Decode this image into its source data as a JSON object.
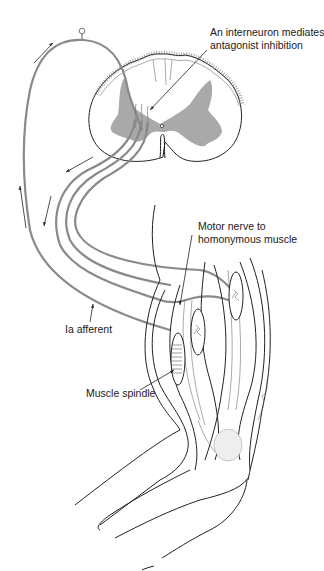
{
  "diagram": {
    "labels": {
      "interneuron": [
        "An interneuron mediates",
        "antagonist inhibition"
      ],
      "motor_nerve": [
        "Motor nerve to",
        "homonymous muscle"
      ],
      "ia_afferent": "Ia afferent",
      "muscle_spindle": "Muscle spindle"
    },
    "colors": {
      "nerve": "#8a8a8a",
      "gray_matter": "#a9a9a9",
      "outline": "#222222",
      "background": "#ffffff"
    },
    "components": [
      "spinal-cord-cross-section",
      "gray-matter",
      "dorsal-root-ganglion",
      "ia-afferent-fiber",
      "motor-nerve-fibers",
      "muscle-spindle",
      "extrafusal-muscle-fibers",
      "arm-elbow-outline"
    ],
    "direction_arrows": 5
  }
}
